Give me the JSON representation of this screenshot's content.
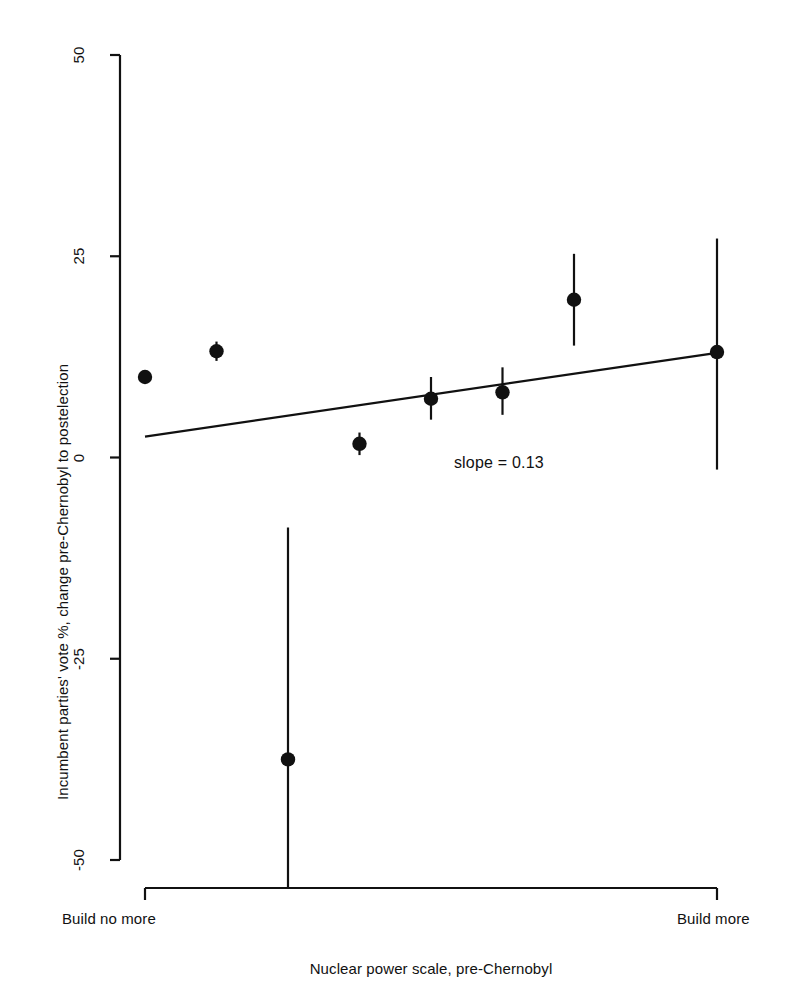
{
  "chart_data": {
    "type": "scatter",
    "title": "",
    "xlabel": "Nuclear power scale, pre-Chernobyl",
    "ylabel": "Incumbent parties' vote %, change pre-Chernobyl to postelection",
    "xlim": [
      0,
      8
    ],
    "ylim": [
      -50,
      50
    ],
    "grid": false,
    "legend": null,
    "x_tick_labels": [
      "Build no more",
      "Build more"
    ],
    "y_ticks": [
      -50,
      -25,
      0,
      25,
      50
    ],
    "y_tick_labels": [
      "-50",
      "-25",
      "0",
      "25",
      "50"
    ],
    "annotations": [
      {
        "text": "slope = 0.13",
        "x": 4.95,
        "y": -1.0
      }
    ],
    "series": [
      {
        "name": "Incumbent vote change by nuclear power scale",
        "marker": "filled-circle",
        "points": [
          {
            "x": 0.0,
            "y": 10.0,
            "ylow": 10.0,
            "yhigh": 10.0
          },
          {
            "x": 1.0,
            "y": 13.2,
            "ylow": 12.0,
            "yhigh": 14.4
          },
          {
            "x": 2.0,
            "y": -37.5,
            "ylow": -54.5,
            "yhigh": -8.7
          },
          {
            "x": 3.0,
            "y": 1.7,
            "ylow": 0.3,
            "yhigh": 3.1
          },
          {
            "x": 4.0,
            "y": 7.3,
            "ylow": 4.7,
            "yhigh": 10.0
          },
          {
            "x": 5.0,
            "y": 8.1,
            "ylow": 5.3,
            "yhigh": 11.2
          },
          {
            "x": 6.0,
            "y": 19.6,
            "ylow": 13.9,
            "yhigh": 25.3
          },
          {
            "x": 8.0,
            "y": 13.1,
            "ylow": -1.5,
            "yhigh": 27.2
          }
        ]
      }
    ],
    "fit_line": {
      "name": "regression-line",
      "slope": 0.13,
      "x_start": 0.0,
      "y_start": 2.6,
      "x_end": 8.0,
      "y_end": 13.0
    }
  },
  "axis": {
    "y_label_text": "Incumbent parties' vote %, change pre-Chernobyl to postelection",
    "x_label_text": "Nuclear power scale, pre-Chernobyl",
    "x_left_label": "Build no more",
    "x_right_label": "Build more",
    "tick_50": "50",
    "tick_25": "25",
    "tick_0": "0",
    "tick_neg25": "-25",
    "tick_neg50": "-50"
  },
  "annotation": {
    "slope_text": "slope = 0.13"
  },
  "colors": {
    "ink": "#111111",
    "background": "#ffffff"
  }
}
